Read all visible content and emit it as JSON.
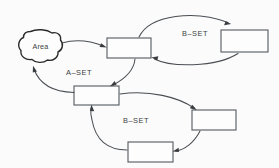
{
  "diagram": {
    "background_color": "#fbfbfc",
    "stroke_color": "#4a4e52",
    "box_fill": "#fdfdfd",
    "blob": {
      "label": "Area",
      "name": "area-blob"
    },
    "labels": [
      {
        "id": "a-set",
        "text": "A–SET",
        "x": 79,
        "y": 75
      },
      {
        "id": "b-set-top",
        "text": "B–SET",
        "x": 195,
        "y": 36
      },
      {
        "id": "b-set-bottom",
        "text": "B–SET",
        "x": 136,
        "y": 123
      }
    ],
    "boxes": [
      {
        "id": "box-top-center",
        "x": 107,
        "y": 38,
        "w": 44,
        "h": 20
      },
      {
        "id": "box-top-right",
        "x": 221,
        "y": 30,
        "w": 47,
        "h": 22
      },
      {
        "id": "box-middle-left",
        "x": 74,
        "y": 86,
        "w": 45,
        "h": 19
      },
      {
        "id": "box-bottom-right",
        "x": 192,
        "y": 110,
        "w": 44,
        "h": 20
      },
      {
        "id": "box-bottom-center",
        "x": 128,
        "y": 142,
        "w": 45,
        "h": 20
      }
    ],
    "edges": [
      {
        "id": "edge-area-to-top-center",
        "from": "area-blob",
        "to": "box-top-center"
      },
      {
        "id": "edge-top-center-to-top-right",
        "from": "box-top-center",
        "to": "box-top-right"
      },
      {
        "id": "edge-top-right-to-top-center",
        "from": "box-top-right",
        "to": "box-top-center"
      },
      {
        "id": "edge-top-center-to-middle-left",
        "from": "box-top-center",
        "to": "box-middle-left"
      },
      {
        "id": "edge-middle-left-to-area",
        "from": "box-middle-left",
        "to": "area-blob"
      },
      {
        "id": "edge-middle-left-to-bottom-right",
        "from": "box-middle-left",
        "to": "box-bottom-right"
      },
      {
        "id": "edge-bottom-right-to-bottom-center",
        "from": "box-bottom-right",
        "to": "box-bottom-center"
      },
      {
        "id": "edge-bottom-center-to-middle-left",
        "from": "box-bottom-center",
        "to": "box-middle-left"
      }
    ]
  }
}
